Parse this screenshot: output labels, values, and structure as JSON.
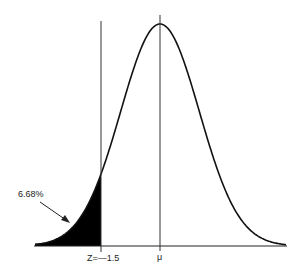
{
  "diagram": {
    "curve": "normal-bell-curve",
    "mean_label": "μ",
    "z_label": "Z=—1.5",
    "shaded_area_label": "6.68%",
    "shaded_region": "left tail below Z=-1.5",
    "colors": {
      "curve": "#111111",
      "fill": "#000000",
      "background": "#ffffff"
    }
  },
  "chart_data": {
    "type": "area",
    "title": "",
    "xlabel": "",
    "ylabel": "",
    "annotations": [
      "6.68%",
      "Z=—1.5",
      "μ"
    ],
    "z_cutoff": -1.5,
    "tail_probability_percent": 6.68,
    "x": [
      -3,
      -2.5,
      -2,
      -1.5,
      -1,
      -0.5,
      0,
      0.5,
      1,
      1.5,
      2,
      2.5,
      3
    ],
    "values": [
      0.0044,
      0.0175,
      0.054,
      0.1295,
      0.242,
      0.3521,
      0.3989,
      0.3521,
      0.242,
      0.1295,
      0.054,
      0.0175,
      0.0044
    ]
  }
}
